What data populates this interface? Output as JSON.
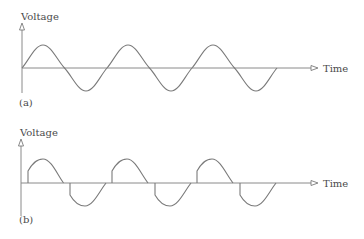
{
  "panels": [
    {
      "id": "a",
      "label": "(a)",
      "y_axis_label": "Voltage",
      "x_axis_label": "Time",
      "waveform": "full sine wave",
      "colors": {
        "axis": "#8a8a8a",
        "wave": "#7a7a7a",
        "text": "#4a4a4a"
      }
    },
    {
      "id": "b",
      "label": "(b)",
      "y_axis_label": "Voltage",
      "x_axis_label": "Time",
      "waveform": "phase-controlled (chopped) sine wave",
      "colors": {
        "axis": "#8a8a8a",
        "wave": "#7a7a7a",
        "text": "#4a4a4a"
      }
    }
  ]
}
